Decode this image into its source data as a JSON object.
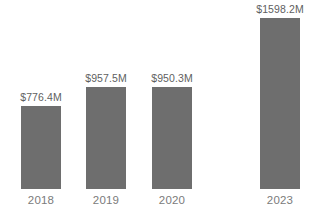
{
  "chart_data": {
    "type": "bar",
    "title": "",
    "subtitle": "",
    "xlabel": "",
    "ylabel": "",
    "categories": [
      "2018",
      "2019",
      "2020",
      "2023"
    ],
    "values": [
      776.4,
      957.5,
      950.3,
      1598.2
    ],
    "value_labels": [
      "$776.4M",
      "$957.5M",
      "$950.3M",
      "$1598.2M"
    ],
    "unit": "M",
    "currency": "$",
    "ylim": [
      0,
      1790
    ],
    "grid": false,
    "legend": false,
    "legend_position": "none",
    "axis_visible": false,
    "bar_color": "#6e6e6e",
    "value_label_color": "#5f5f5f",
    "category_label_color": "#7b7b7b",
    "background_color": "#ffffff"
  },
  "bars": [
    {
      "category": "2018",
      "value": 776.4,
      "label": "$776.4M",
      "height_px": 84
    },
    {
      "category": "2019",
      "value": 957.5,
      "label": "$957.5M",
      "height_px": 101
    },
    {
      "category": "2020",
      "value": 950.3,
      "label": "$950.3M",
      "height_px": 101
    },
    {
      "category": "2023",
      "value": 1598.2,
      "label": "$1598.2M",
      "height_px": 171
    }
  ]
}
